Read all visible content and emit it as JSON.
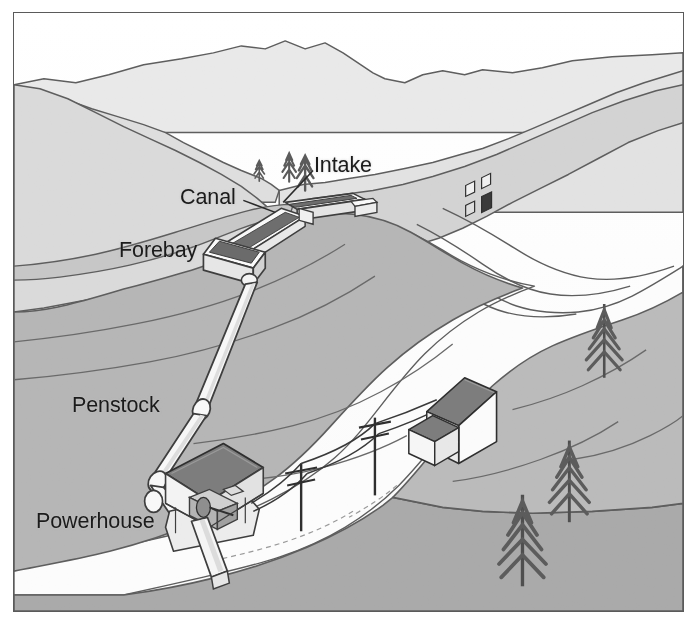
{
  "figure": {
    "type": "labeled-illustration",
    "frame": {
      "border_color": "#5a5a5a",
      "background": "#ffffff"
    }
  },
  "labels": [
    {
      "id": "intake",
      "text": "Intake",
      "x": 300,
      "y": 142,
      "leader": true
    },
    {
      "id": "canal",
      "text": "Canal",
      "x": 166,
      "y": 174,
      "leader": true
    },
    {
      "id": "forebay",
      "text": "Forebay",
      "x": 105,
      "y": 227,
      "leader": false
    },
    {
      "id": "penstock",
      "text": "Penstock",
      "x": 58,
      "y": 382,
      "leader": false
    },
    {
      "id": "powerhouse",
      "text": "Powerhouse",
      "x": 22,
      "y": 498,
      "leader": false
    }
  ],
  "scene_elements": [
    {
      "name": "sky",
      "tone": "#ffffff"
    },
    {
      "name": "far-mountains",
      "tone": "#e6e6e6"
    },
    {
      "name": "mid-ridges",
      "tone": "#d6d6d6"
    },
    {
      "name": "upper-slopes",
      "tone": "#cdcdcd"
    },
    {
      "name": "valley-floor",
      "tone": "#bdbdbd"
    },
    {
      "name": "foreground-hill",
      "tone": "#b0b0b0"
    },
    {
      "name": "river",
      "tone": "#fbfbfb"
    },
    {
      "name": "outline",
      "tone": "#4a4a4a"
    },
    {
      "name": "structure-white",
      "tone": "#f7f7f7"
    },
    {
      "name": "roof-dark",
      "tone": "#7a7a7a"
    },
    {
      "name": "tree-dark",
      "tone": "#5e5e5e"
    }
  ],
  "components": [
    {
      "name": "intake-weir",
      "description": "diversion weir across upper stream"
    },
    {
      "name": "canal-flume",
      "description": "open channel from intake to forebay"
    },
    {
      "name": "forebay-tank",
      "description": "settling box at head of penstock"
    },
    {
      "name": "penstock-pipe",
      "description": "pressure pipe descending slope"
    },
    {
      "name": "powerhouse-building",
      "description": "cutaway building with turbine and generator"
    },
    {
      "name": "tailrace",
      "description": "outflow channel returning water to river"
    },
    {
      "name": "power-pole",
      "count": 2
    },
    {
      "name": "power-line",
      "description": "transmission line to farmhouse"
    },
    {
      "name": "farmhouse",
      "description": "white house with dark roof and side wing"
    },
    {
      "name": "conifer-tree",
      "count": 6
    }
  ],
  "colors": {
    "ink": "#1b1b1b",
    "outline": "#4a4a4a",
    "frame": "#5a5a5a",
    "sky": "#ffffff",
    "terrain_light": "#e6e6e6",
    "terrain_mid": "#cdcdcd",
    "terrain_dark": "#b0b0b0",
    "water": "#fbfbfb",
    "roof": "#7a7a7a",
    "structure": "#f7f7f7"
  }
}
